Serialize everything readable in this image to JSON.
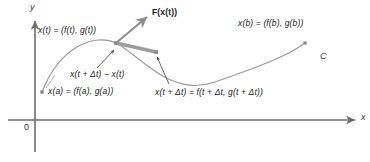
{
  "figure": {
    "background_color": "#ffffff",
    "width": 370,
    "height": 162
  },
  "axes": {
    "y_label": "y",
    "x_label": "x",
    "origin_label": "0",
    "axis_color": "#6e6e6e",
    "y_axis": {
      "x": 35,
      "top": 16,
      "bottom": 152
    },
    "x_axis": {
      "y": 120,
      "left": 8,
      "right": 361
    }
  },
  "curve": {
    "name": "C",
    "label": "C",
    "color": "#9a9a9a",
    "stroke_width": 1.1,
    "path": "M 42,92 C 60,46 95,33 116,43 C 140,55 170,98 215,82 C 258,67 288,56 305,43"
  },
  "points": [
    {
      "id": "point-a",
      "label_key": "x_a",
      "x": 42,
      "y": 92,
      "marker": "square",
      "color": "#8a8a8a"
    },
    {
      "id": "point-t",
      "label_key": "x_t",
      "x": 116,
      "y": 43,
      "marker": "square",
      "color": "#8a8a8a"
    },
    {
      "id": "point-dt",
      "label_key": "x_t_dt",
      "x": 156,
      "y": 52,
      "marker": "square",
      "color": "#8a8a8a"
    },
    {
      "id": "point-b",
      "label_key": "x_b",
      "x": 305,
      "y": 43,
      "marker": "square",
      "color": "#8a8a8a"
    }
  ],
  "vectors": {
    "field_vector": {
      "name": "F(x(t))",
      "from_x": 116,
      "from_y": 43,
      "to_x": 147,
      "to_y": 17,
      "color": "#8d8d8d"
    },
    "secant_vector": {
      "name": "x(t + Δt) − x(t)",
      "from_x": 116,
      "from_y": 43,
      "to_x": 156,
      "to_y": 52,
      "color": "#9c9c9c"
    }
  },
  "labels": {
    "F_of_x_t": {
      "text": "F(x(t))",
      "bold_part": "F",
      "rest": "(",
      "bold2": "x",
      "rest2": "(t))",
      "x": 152,
      "y": 8
    },
    "x_t": {
      "text": "x(t) = (f(t), g(t))",
      "x": 38,
      "y": 26
    },
    "x_a": {
      "text": "x(a) = (f(a), g(a))",
      "x": 48,
      "y": 87
    },
    "x_b": {
      "text": "x(b) = (f(b), g(b))",
      "x": 238,
      "y": 19
    },
    "secant": {
      "text": "x(t + Δt) − x(t)",
      "x": 70,
      "y": 70
    },
    "x_t_dt": {
      "text": "x(t + Δt) = f(t + Δt, g(t + Δt))",
      "x": 155,
      "y": 88
    },
    "curve_c": {
      "text": "C",
      "x": 320,
      "y": 51
    }
  },
  "leader_lines": [
    {
      "name": "leader-to-secant-midpoint",
      "x1": 97,
      "y1": 68,
      "x2": 114,
      "y2": 50
    },
    {
      "name": "leader-to-point-dt",
      "x1": 169,
      "y1": 84,
      "x2": 157,
      "y2": 57
    },
    {
      "name": "leader-to-point-a",
      "x1": 46,
      "y1": 88,
      "x2": 55,
      "y2": 75
    }
  ]
}
